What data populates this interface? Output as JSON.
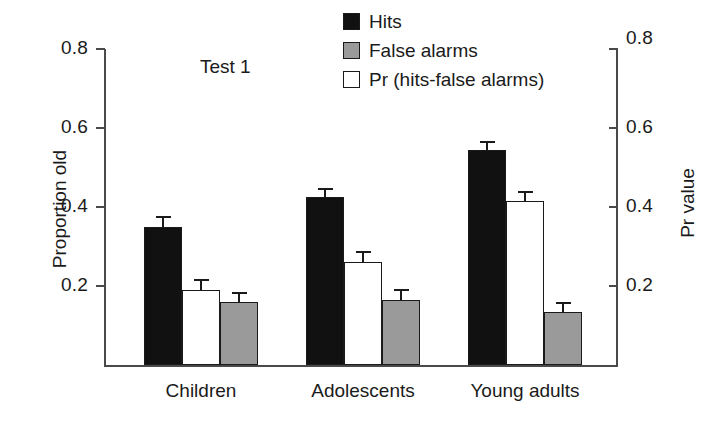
{
  "chart_data": {
    "type": "bar",
    "title": "",
    "annotation": "Test 1",
    "categories": [
      "Children",
      "Adolescents",
      "Young adults"
    ],
    "series": [
      {
        "name": "Hits",
        "color": "#111111",
        "values": [
          0.35,
          0.425,
          0.545
        ],
        "errors": [
          0.027,
          0.022,
          0.022
        ]
      },
      {
        "name": "Pr (hits-false alarms)",
        "color": "#ffffff",
        "values": [
          0.19,
          0.26,
          0.415
        ],
        "errors": [
          0.028,
          0.028,
          0.025
        ]
      },
      {
        "name": "False alarms",
        "color": "#9a9a9a",
        "values": [
          0.16,
          0.165,
          0.135
        ],
        "errors": [
          0.025,
          0.028,
          0.025
        ]
      }
    ],
    "bar_order": [
      "Hits",
      "Pr (hits-false alarms)",
      "False alarms"
    ],
    "ylabel": "Proportion old",
    "ylabel_right": "Pr value",
    "xlabel": "",
    "ylim": [
      0.0,
      0.8
    ],
    "yticks": [
      "0.2",
      "0.4",
      "0.6",
      "0.8"
    ],
    "ytick_values": [
      0.2,
      0.4,
      0.6,
      0.8
    ],
    "yticks_right": [
      "0.2",
      "0.4",
      "0.6",
      "0.8"
    ],
    "ytick_values_right": [
      0.2,
      0.4,
      0.6,
      0.8
    ],
    "grid": false,
    "legend_position": "top-center",
    "error_bars": "upper-only"
  },
  "legend": {
    "items": [
      {
        "label": "Hits",
        "swatch": "black-filled-square"
      },
      {
        "label": "False alarms",
        "swatch": "gray-filled-square"
      },
      {
        "label": "Pr (hits-false alarms)",
        "swatch": "white-open-square"
      }
    ]
  }
}
